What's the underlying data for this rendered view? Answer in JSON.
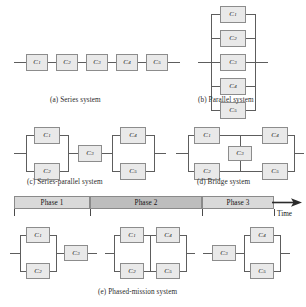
{
  "figure": {
    "title_note": "Reliability block diagrams of system structures",
    "component_prefix": "C",
    "colors": {
      "block_fill": "#e9e9e9",
      "block_border": "#8c8c8c",
      "wire": "#5d5d5d",
      "phase_light": "#d9d9d9",
      "phase_dark": "#bdbdbd",
      "text": "#141414"
    }
  },
  "captions": {
    "a": "(a) Series system",
    "b": "(b) Parallel system",
    "c": "(c) Series-parallel system",
    "d": "(d) Bridge system",
    "e": "(e) Phased-mission system"
  },
  "series_system": {
    "blocks": [
      {
        "id": "C1",
        "label": "C",
        "sub": "1"
      },
      {
        "id": "C2",
        "label": "C",
        "sub": "2"
      },
      {
        "id": "C3",
        "label": "C",
        "sub": "3"
      },
      {
        "id": "C4",
        "label": "C",
        "sub": "4"
      },
      {
        "id": "C5",
        "label": "C",
        "sub": "5"
      }
    ]
  },
  "parallel_system": {
    "blocks": [
      {
        "id": "C1",
        "label": "C",
        "sub": "1"
      },
      {
        "id": "C2",
        "label": "C",
        "sub": "2"
      },
      {
        "id": "C3",
        "label": "C",
        "sub": "3"
      },
      {
        "id": "C4",
        "label": "C",
        "sub": "4"
      },
      {
        "id": "C5",
        "label": "C",
        "sub": "5"
      }
    ]
  },
  "series_parallel_system": {
    "blocks": [
      {
        "id": "C1",
        "label": "C",
        "sub": "1"
      },
      {
        "id": "C2",
        "label": "C",
        "sub": "2"
      },
      {
        "id": "C3",
        "label": "C",
        "sub": "3"
      },
      {
        "id": "C4",
        "label": "C",
        "sub": "4"
      },
      {
        "id": "C5",
        "label": "C",
        "sub": "5"
      }
    ]
  },
  "bridge_system": {
    "blocks": [
      {
        "id": "C1",
        "label": "C",
        "sub": "1"
      },
      {
        "id": "C2",
        "label": "C",
        "sub": "2"
      },
      {
        "id": "C3",
        "label": "C",
        "sub": "3"
      },
      {
        "id": "C4",
        "label": "C",
        "sub": "4"
      },
      {
        "id": "C5",
        "label": "C",
        "sub": "5"
      }
    ]
  },
  "phase_bar": {
    "time_label": "Time",
    "phases": [
      {
        "id": "phase1",
        "label": "Phase 1"
      },
      {
        "id": "phase2",
        "label": "Phase 2"
      },
      {
        "id": "phase3",
        "label": "Phase 3"
      }
    ]
  },
  "phased_mission_system": {
    "phase1_blocks": [
      {
        "id": "C1",
        "label": "C",
        "sub": "1"
      },
      {
        "id": "C2",
        "label": "C",
        "sub": "2"
      },
      {
        "id": "C3",
        "label": "C",
        "sub": "3"
      }
    ],
    "phase2_blocks": [
      {
        "id": "C1",
        "label": "C",
        "sub": "1"
      },
      {
        "id": "C2",
        "label": "C",
        "sub": "2"
      },
      {
        "id": "C4",
        "label": "C",
        "sub": "4"
      },
      {
        "id": "C5",
        "label": "C",
        "sub": "5"
      }
    ],
    "phase3_blocks": [
      {
        "id": "C3",
        "label": "C",
        "sub": "3"
      },
      {
        "id": "C4",
        "label": "C",
        "sub": "4"
      },
      {
        "id": "C5",
        "label": "C",
        "sub": "5"
      }
    ]
  }
}
